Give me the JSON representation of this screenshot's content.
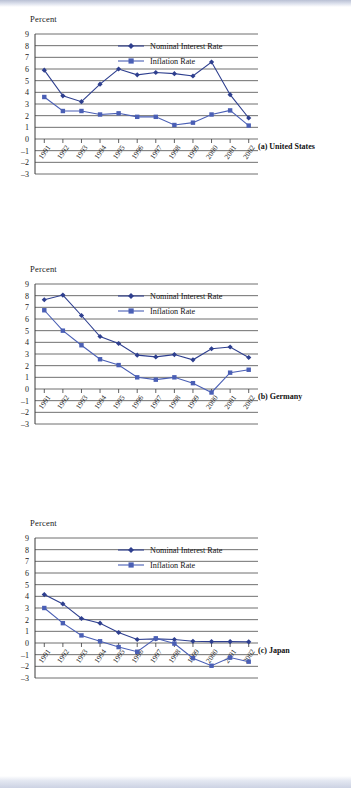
{
  "figure": {
    "axis_label": "Percent",
    "legend": [
      {
        "key": "nominal",
        "label": "Nominal Interest Rate",
        "marker": "diamond",
        "color": "#2e3f8f"
      },
      {
        "key": "inflation",
        "label": "Inflation Rate",
        "marker": "square",
        "color": "#4a5fb5"
      }
    ],
    "yticks": [
      "9",
      "8",
      "7",
      "6",
      "5",
      "4",
      "3",
      "2",
      "1",
      "0",
      "–1",
      "–2",
      "–3"
    ],
    "xticks": [
      "1991",
      "1992",
      "1993",
      "1994",
      "1995",
      "1996",
      "1997",
      "1998",
      "1999",
      "2000",
      "2001",
      "2002"
    ]
  },
  "chart_data": [
    {
      "type": "line",
      "title": "(a) United States",
      "panel": "a",
      "xlabel": "",
      "ylabel": "Percent",
      "ylim": [
        -3,
        9
      ],
      "grid": true,
      "legend_position": "top-center",
      "categories": [
        "1991",
        "1992",
        "1993",
        "1994",
        "1995",
        "1996",
        "1997",
        "1998",
        "1999",
        "2000",
        "2001",
        "2002"
      ],
      "series": [
        {
          "name": "Nominal Interest Rate",
          "values": [
            5.9,
            3.7,
            3.2,
            4.7,
            6.0,
            5.5,
            5.7,
            5.6,
            5.4,
            6.6,
            3.8,
            1.8
          ]
        },
        {
          "name": "Inflation Rate",
          "values": [
            3.6,
            2.4,
            2.4,
            2.1,
            2.2,
            1.9,
            1.9,
            1.2,
            1.4,
            2.1,
            2.45,
            1.15
          ]
        }
      ]
    },
    {
      "type": "line",
      "title": "(b) Germany",
      "panel": "b",
      "xlabel": "",
      "ylabel": "Percent",
      "ylim": [
        -3,
        9
      ],
      "grid": true,
      "legend_position": "top-center",
      "categories": [
        "1991",
        "1992",
        "1993",
        "1994",
        "1995",
        "1996",
        "1997",
        "1998",
        "1999",
        "2000",
        "2001",
        "2002"
      ],
      "series": [
        {
          "name": "Nominal Interest Rate",
          "values": [
            7.65,
            8.05,
            6.3,
            4.5,
            3.9,
            2.9,
            2.75,
            2.95,
            2.5,
            3.45,
            3.6,
            2.7
          ]
        },
        {
          "name": "Inflation Rate",
          "values": [
            6.75,
            5.0,
            3.75,
            2.55,
            2.05,
            1.0,
            0.8,
            1.0,
            0.5,
            -0.3,
            1.4,
            1.65
          ]
        }
      ]
    },
    {
      "type": "line",
      "title": "(c) Japan",
      "panel": "c",
      "xlabel": "",
      "ylabel": "Percent",
      "ylim": [
        -3,
        9
      ],
      "grid": true,
      "legend_position": "top-center",
      "categories": [
        "1991",
        "1992",
        "1993",
        "1994",
        "1995",
        "1996",
        "1997",
        "1998",
        "1999",
        "2000",
        "2001",
        "2002"
      ],
      "series": [
        {
          "name": "Nominal Interest Rate",
          "values": [
            4.15,
            3.35,
            2.1,
            1.7,
            0.9,
            0.3,
            0.35,
            0.3,
            0.15,
            0.12,
            0.12,
            0.1
          ]
        },
        {
          "name": "Inflation Rate",
          "values": [
            3.0,
            1.7,
            0.65,
            0.15,
            -0.35,
            -0.75,
            0.4,
            -0.05,
            -1.3,
            -1.95,
            -1.25,
            -1.6
          ]
        }
      ]
    }
  ]
}
